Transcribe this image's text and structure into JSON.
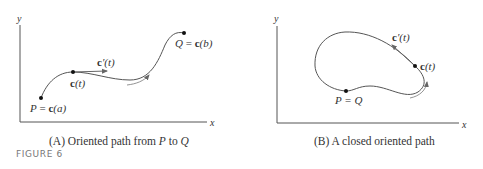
{
  "figure_label": "FIGURE 6",
  "panels": [
    {
      "id": "A",
      "caption_prefix": "(A) Oriented path from ",
      "caption_P": "P",
      "caption_mid": " to ",
      "caption_Q": "Q",
      "axis_x": "x",
      "axis_y": "y",
      "labels": {
        "start": "P = c(a)",
        "start_P": "P",
        "start_eq": " = ",
        "start_c": "c",
        "start_arg": "(a)",
        "point": "c(t)",
        "point_c": "c",
        "point_arg": "(t)",
        "tangent_c": "c",
        "tangent_rest": "′(t)",
        "end_Q": "Q",
        "end_eq": " = ",
        "end_c": "c",
        "end_arg": "(b)"
      }
    },
    {
      "id": "B",
      "caption": "(B) A closed oriented path",
      "axis_x": "x",
      "axis_y": "y",
      "labels": {
        "start": "P = Q",
        "point_c": "c",
        "point_arg": "(t)",
        "tangent_c": "c",
        "tangent_rest": "′(t)"
      }
    }
  ],
  "colors": {
    "curve": "#555555",
    "axis": "#555555",
    "text": "#333333",
    "figure_label": "#777777"
  }
}
